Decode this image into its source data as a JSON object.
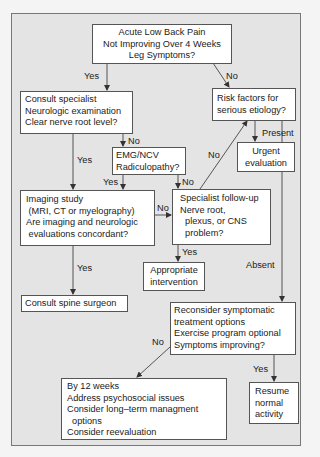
{
  "nodes": {
    "start": {
      "lines": [
        "Acute Low Back Pain",
        "Not Improving Over 4 Weeks",
        "Leg Symptoms?"
      ]
    },
    "consult": {
      "lines": [
        "Consult specialist",
        "Neurologic examination",
        "Clear nerve root level?"
      ]
    },
    "risk": {
      "lines": [
        "Risk factors for",
        "serious etiology?"
      ]
    },
    "urgent": {
      "lines": [
        "Urgent",
        "evaluation"
      ]
    },
    "emg": {
      "lines": [
        "EMG/NCV",
        "Radiculopathy?"
      ]
    },
    "imaging": {
      "lines": [
        "Imaging study",
        " (MRI, CT or myelography)",
        "Are imaging and neurologic",
        " evaluations concordant?"
      ]
    },
    "specialist": {
      "lines": [
        "Specialist follow-up",
        "Nerve root,",
        "  plexus, or CNS",
        "  problem?"
      ]
    },
    "appropriate": {
      "lines": [
        "Appropriate",
        "intervention"
      ]
    },
    "surgeon": {
      "lines": [
        "Consult spine surgeon"
      ]
    },
    "reconsider": {
      "lines": [
        "Reconsider symptomatic",
        "treatment options",
        "Exercise program optional",
        "Symptoms improving?"
      ]
    },
    "weeks12": {
      "lines": [
        "By 12 weeks",
        "Address psychosocial issues",
        "Consider long–term managment",
        "  options",
        "Consider reevaluation"
      ]
    },
    "resume": {
      "lines": [
        "Resume",
        "normal",
        "activity"
      ]
    }
  },
  "edge_labels": {
    "start_yes": "Yes",
    "start_no": "No",
    "consult_no": "No",
    "consult_yes": "Yes",
    "emg_yes": "Yes",
    "emg_no": "No",
    "specialist_no": "No",
    "imaging_no": "No",
    "risk_present": "Present",
    "specialist_yes": "Yes",
    "imaging_yes": "Yes",
    "risk_absent": "Absent",
    "reconsider_no": "No",
    "reconsider_yes": "Yes"
  },
  "colors": {
    "frame_bg": "#e4e4e4",
    "box_bg": "#ffffff",
    "line": "#444444"
  }
}
